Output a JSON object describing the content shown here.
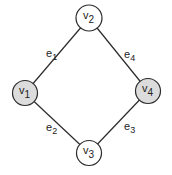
{
  "diagram": {
    "nodes": [
      {
        "id": "v1",
        "name": "v",
        "sub": "1",
        "cx": 25,
        "cy": 93,
        "r": 12.5,
        "fill": "#dcdcdc"
      },
      {
        "id": "v2",
        "name": "v",
        "sub": "2",
        "cx": 89,
        "cy": 18,
        "r": 13,
        "fill": "#ffffff"
      },
      {
        "id": "v3",
        "name": "v",
        "sub": "3",
        "cx": 89,
        "cy": 153,
        "r": 12.5,
        "fill": "#ffffff"
      },
      {
        "id": "v4",
        "name": "v",
        "sub": "4",
        "cx": 148,
        "cy": 91,
        "r": 12.5,
        "fill": "#dcdcdc"
      }
    ],
    "edges": [
      {
        "id": "e1",
        "name": "e",
        "sub": "1",
        "from": "v1",
        "to": "v2",
        "lx": 46,
        "ly": 57
      },
      {
        "id": "e2",
        "name": "e",
        "sub": "2",
        "from": "v1",
        "to": "v3",
        "lx": 46,
        "ly": 131
      },
      {
        "id": "e3",
        "name": "e",
        "sub": "3",
        "from": "v3",
        "to": "v4",
        "lx": 124,
        "ly": 130
      },
      {
        "id": "e4",
        "name": "e",
        "sub": "4",
        "from": "v2",
        "to": "v4",
        "lx": 124,
        "ly": 58
      }
    ]
  }
}
